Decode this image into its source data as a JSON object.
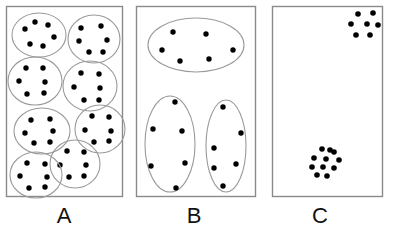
{
  "figure": {
    "title": "",
    "width": 395,
    "height": 232,
    "background_color": "#ffffff",
    "panel_border_color": "#8a8a8a",
    "ellipse_stroke_color": "#9a9a9a",
    "dot_color": "#000000",
    "label_color": "#111111"
  },
  "panels": [
    {
      "id": "A",
      "label": "A",
      "label_x": 64,
      "label_y": 205,
      "frame": {
        "x": 6,
        "y": 6,
        "width": 116,
        "height": 190
      },
      "grouping": "many-small-groups",
      "group_count": 8,
      "dots_per_group": 6,
      "total_dots": 48,
      "groups": [
        {
          "cx": 39,
          "cy": 35,
          "rx": 27,
          "ry": 22,
          "dots": [
            [
              -14,
              -6
            ],
            [
              -4,
              -13
            ],
            [
              9,
              -10
            ],
            [
              15,
              2
            ],
            [
              4,
              11
            ],
            [
              -9,
              9
            ]
          ]
        },
        {
          "cx": 94,
          "cy": 39,
          "rx": 26,
          "ry": 24,
          "dots": [
            [
              -13,
              -11
            ],
            [
              7,
              -13
            ],
            [
              -15,
              2
            ],
            [
              13,
              1
            ],
            [
              -5,
              13
            ],
            [
              9,
              13
            ]
          ]
        },
        {
          "cx": 35,
          "cy": 81,
          "rx": 27,
          "ry": 24,
          "dots": [
            [
              -9,
              -13
            ],
            [
              8,
              -13
            ],
            [
              -16,
              0
            ],
            [
              10,
              1
            ],
            [
              -8,
              13
            ],
            [
              9,
              12
            ]
          ]
        },
        {
          "cx": 90,
          "cy": 86,
          "rx": 27,
          "ry": 25,
          "dots": [
            [
              -9,
              -13
            ],
            [
              9,
              -12
            ],
            [
              -16,
              1
            ],
            [
              10,
              2
            ],
            [
              -6,
              14
            ],
            [
              9,
              14
            ]
          ]
        },
        {
          "cx": 100,
          "cy": 129,
          "rx": 25,
          "ry": 24,
          "dots": [
            [
              -8,
              -13
            ],
            [
              9,
              -12
            ],
            [
              -15,
              1
            ],
            [
              11,
              2
            ],
            [
              -6,
              13
            ],
            [
              9,
              12
            ]
          ]
        },
        {
          "cx": 42,
          "cy": 131,
          "rx": 28,
          "ry": 23,
          "dots": [
            [
              -11,
              -11
            ],
            [
              8,
              -12
            ],
            [
              -17,
              2
            ],
            [
              11,
              0
            ],
            [
              -8,
              12
            ],
            [
              8,
              11
            ]
          ]
        },
        {
          "cx": 75,
          "cy": 164,
          "rx": 25,
          "ry": 24,
          "dots": [
            [
              -8,
              -13
            ],
            [
              9,
              -12
            ],
            [
              -15,
              1
            ],
            [
              11,
              1
            ],
            [
              -6,
              13
            ],
            [
              9,
              12
            ]
          ]
        },
        {
          "cx": 36,
          "cy": 175,
          "rx": 26,
          "ry": 23,
          "dots": [
            [
              -9,
              -12
            ],
            [
              9,
              -11
            ],
            [
              -16,
              1
            ],
            [
              11,
              2
            ],
            [
              -7,
              13
            ],
            [
              9,
              12
            ]
          ]
        }
      ]
    },
    {
      "id": "B",
      "label": "B",
      "label_x": 194,
      "label_y": 205,
      "frame": {
        "x": 136,
        "y": 6,
        "width": 119,
        "height": 190
      },
      "grouping": "few-large-groups",
      "group_count": 3,
      "dots_per_group": 6,
      "total_dots": 18,
      "groups": [
        {
          "cx": 196,
          "cy": 45,
          "rx": 48,
          "ry": 27,
          "dots": [
            [
              -23,
              -13
            ],
            [
              10,
              -11
            ],
            [
              -34,
              5
            ],
            [
              37,
              5
            ],
            [
              -16,
              16
            ],
            [
              13,
              14
            ]
          ]
        },
        {
          "cx": 170,
          "cy": 144,
          "rx": 25,
          "ry": 48,
          "dots": [
            [
              5,
              -42
            ],
            [
              -17,
              -15
            ],
            [
              12,
              -13
            ],
            [
              -19,
              22
            ],
            [
              15,
              19
            ],
            [
              6,
              44
            ]
          ]
        },
        {
          "cx": 226,
          "cy": 146,
          "rx": 20,
          "ry": 46,
          "dots": [
            [
              -3,
              -39
            ],
            [
              15,
              -13
            ],
            [
              -12,
              2
            ],
            [
              10,
              18
            ],
            [
              -12,
              22
            ],
            [
              -3,
              40
            ]
          ]
        }
      ]
    },
    {
      "id": "C",
      "label": "C",
      "label_x": 320,
      "label_y": 205,
      "frame": {
        "x": 272,
        "y": 6,
        "width": 110,
        "height": 190
      },
      "grouping": "no-enclosing-groups",
      "group_count": 0,
      "cluster_count": 2,
      "total_dots": 18,
      "clusters": [
        {
          "name": "top-right-cluster",
          "dot_count": 7,
          "dots": [
            [
              358,
              14
            ],
            [
              373,
              13
            ],
            [
              351,
              24
            ],
            [
              367,
              24
            ],
            [
              356,
              35
            ],
            [
              370,
              35
            ],
            [
              378,
              25
            ]
          ]
        },
        {
          "name": "bottom-left-cluster",
          "dot_count": 11,
          "dots": [
            [
              322,
              149
            ],
            [
              334,
              152
            ],
            [
              314,
              158
            ],
            [
              326,
              159
            ],
            [
              339,
              160
            ],
            [
              312,
              167
            ],
            [
              323,
              167
            ],
            [
              334,
              168
            ],
            [
              317,
              175
            ],
            [
              327,
              176
            ],
            [
              330,
              150
            ]
          ]
        }
      ]
    }
  ]
}
